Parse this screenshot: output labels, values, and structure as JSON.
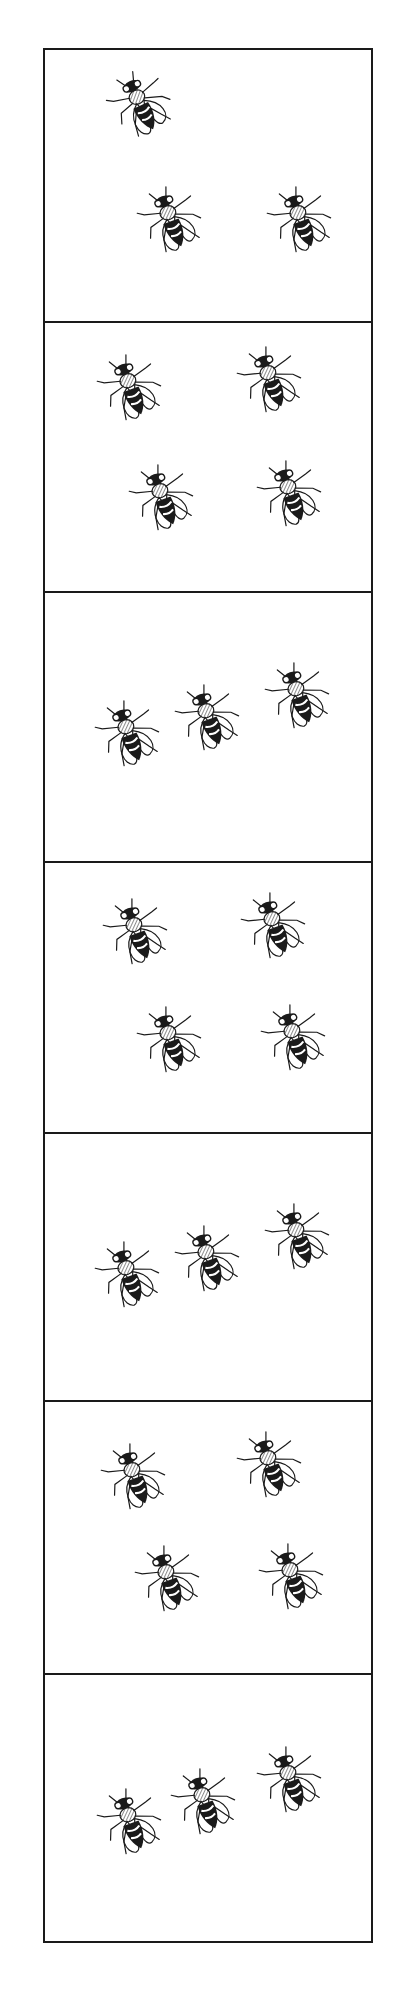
{
  "figure": {
    "stroke_color": "#1a1a1a",
    "background_color": "#ffffff",
    "panels": [
      {
        "index": 1,
        "fly_count": 3,
        "arrangement": "triangle",
        "flies": [
          {
            "x": 62,
            "y": 18,
            "rot": -25
          },
          {
            "x": 92,
            "y": 134,
            "rot": -20
          },
          {
            "x": 222,
            "y": 134,
            "rot": -20
          }
        ]
      },
      {
        "index": 2,
        "fly_count": 4,
        "arrangement": "square",
        "flies": [
          {
            "x": 52,
            "y": 30,
            "rot": -20
          },
          {
            "x": 192,
            "y": 22,
            "rot": -20
          },
          {
            "x": 84,
            "y": 140,
            "rot": -20
          },
          {
            "x": 212,
            "y": 136,
            "rot": -20
          }
        ]
      },
      {
        "index": 3,
        "fly_count": 3,
        "arrangement": "diagonal-row",
        "flies": [
          {
            "x": 50,
            "y": 106,
            "rot": -20
          },
          {
            "x": 130,
            "y": 90,
            "rot": -20
          },
          {
            "x": 220,
            "y": 68,
            "rot": -20
          }
        ]
      },
      {
        "index": 4,
        "fly_count": 4,
        "arrangement": "square",
        "flies": [
          {
            "x": 58,
            "y": 34,
            "rot": -20
          },
          {
            "x": 196,
            "y": 28,
            "rot": -20
          },
          {
            "x": 92,
            "y": 142,
            "rot": -20
          },
          {
            "x": 216,
            "y": 140,
            "rot": -20
          }
        ]
      },
      {
        "index": 5,
        "fly_count": 3,
        "arrangement": "diagonal-row",
        "flies": [
          {
            "x": 50,
            "y": 106,
            "rot": -20
          },
          {
            "x": 130,
            "y": 90,
            "rot": -20
          },
          {
            "x": 220,
            "y": 68,
            "rot": -20
          }
        ]
      },
      {
        "index": 6,
        "fly_count": 4,
        "arrangement": "square",
        "flies": [
          {
            "x": 56,
            "y": 40,
            "rot": -20
          },
          {
            "x": 192,
            "y": 28,
            "rot": -20
          },
          {
            "x": 90,
            "y": 142,
            "rot": -20
          },
          {
            "x": 214,
            "y": 140,
            "rot": -20
          }
        ]
      },
      {
        "index": 7,
        "fly_count": 3,
        "arrangement": "diagonal-row",
        "flies": [
          {
            "x": 52,
            "y": 112,
            "rot": -20
          },
          {
            "x": 126,
            "y": 92,
            "rot": -20
          },
          {
            "x": 212,
            "y": 70,
            "rot": -20
          }
        ]
      }
    ],
    "panel_tops": [
      0,
      272,
      542,
      812,
      1083,
      1351,
      1624
    ],
    "panel_height": 270
  }
}
